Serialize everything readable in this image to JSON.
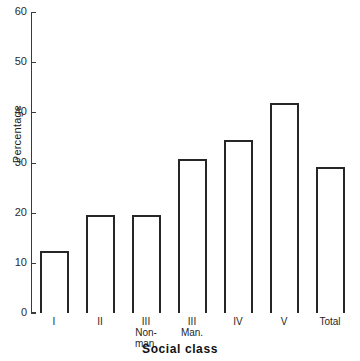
{
  "chart_data": {
    "type": "bar",
    "title": "",
    "xlabel": "Social class",
    "ylabel": "Percentage",
    "categories": [
      "I",
      "II",
      "III Non-man.",
      "III Man.",
      "IV",
      "V",
      "Total"
    ],
    "category_lines": [
      [
        "I"
      ],
      [
        "II"
      ],
      [
        "III",
        "Non-",
        "man."
      ],
      [
        "III",
        "Man."
      ],
      [
        "IV"
      ],
      [
        "V"
      ],
      [
        "Total"
      ]
    ],
    "values": [
      12.3,
      19.5,
      19.5,
      30.7,
      34.5,
      41.8,
      29.1
    ],
    "ylim": [
      0,
      60
    ],
    "ytick_values": [
      0,
      10,
      20,
      30,
      40,
      50,
      60
    ],
    "ytick_labels": [
      "0",
      "10",
      "20",
      "30",
      "40",
      "50",
      "60"
    ],
    "grid": false,
    "legend": false,
    "bar_fill": "#ffffff",
    "bar_edge": "#262626",
    "axis_color": "#3a3a3a"
  }
}
